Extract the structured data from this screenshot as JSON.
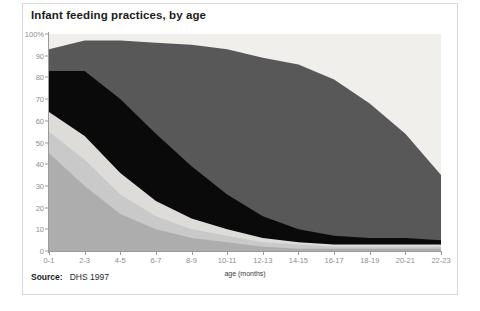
{
  "card": {
    "title": "Infant feeding practices, by age",
    "source_label": "Source:",
    "source_value": "DHS 1997"
  },
  "chart_data": {
    "type": "area",
    "stacked": true,
    "normalized": true,
    "title": "Infant feeding practices, by age",
    "xlabel": "age (months)",
    "ylabel": "",
    "ylim": [
      0,
      100
    ],
    "grid": false,
    "legend": "none",
    "y_ticks": [
      "0",
      "10",
      "20",
      "30",
      "40",
      "50",
      "60",
      "70",
      "80",
      "90",
      "100%"
    ],
    "y_tick_values": [
      0,
      10,
      20,
      30,
      40,
      50,
      60,
      70,
      80,
      90,
      100
    ],
    "categories": [
      "0-1",
      "2-3",
      "4-5",
      "6-7",
      "8-9",
      "10-11",
      "12-13",
      "14-15",
      "16-17",
      "18-19",
      "20-21",
      "22-23"
    ],
    "colors": {
      "band1": "#adadad",
      "band2": "#c9c9c9",
      "band3": "#dddcd8",
      "band4": "#0a0a0a",
      "band5": "#585858",
      "plot_background": "#f0efec",
      "axis": "#9a9a9a",
      "tick_text": "#8e8e8e",
      "title_text": "#1b1b1b"
    },
    "series": [
      {
        "name": "band1",
        "color": "#adadad",
        "values": [
          45,
          30,
          17,
          10,
          6,
          4,
          2,
          1,
          1,
          1,
          1,
          1
        ]
      },
      {
        "name": "band2",
        "color": "#c9c9c9",
        "values": [
          10,
          12,
          9,
          6,
          4,
          3,
          2,
          2,
          1,
          1,
          1,
          1
        ]
      },
      {
        "name": "band3",
        "color": "#dddcd8",
        "values": [
          9,
          11,
          10,
          7,
          5,
          3,
          2,
          1,
          1,
          1,
          1,
          1
        ]
      },
      {
        "name": "band4",
        "color": "#0a0a0a",
        "values": [
          19,
          30,
          34,
          31,
          24,
          16,
          10,
          6,
          4,
          3,
          3,
          2
        ]
      },
      {
        "name": "band5",
        "color": "#585858",
        "values": [
          10,
          14,
          27,
          42,
          56,
          67,
          73,
          76,
          72,
          62,
          48,
          30
        ]
      }
    ],
    "cumulative_tops": {
      "band1": [
        45,
        30,
        17,
        10,
        6,
        4,
        2,
        1,
        1,
        1,
        1,
        1
      ],
      "band2": [
        55,
        42,
        26,
        16,
        10,
        7,
        4,
        3,
        2,
        2,
        2,
        2
      ],
      "band3": [
        64,
        53,
        36,
        23,
        15,
        10,
        6,
        4,
        3,
        3,
        3,
        3
      ],
      "band4": [
        83,
        83,
        70,
        54,
        39,
        26,
        16,
        10,
        7,
        6,
        6,
        5
      ],
      "band5": [
        93,
        97,
        97,
        96,
        95,
        93,
        89,
        86,
        79,
        68,
        54,
        35
      ]
    }
  }
}
